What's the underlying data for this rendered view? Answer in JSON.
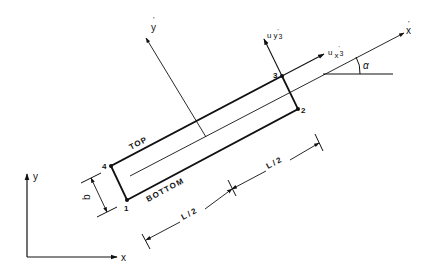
{
  "diagram": {
    "global_axes": {
      "x_label": "x",
      "y_label": "y"
    },
    "local_axes": {
      "x_label": "x",
      "x_prime": "'",
      "y_label": "y",
      "y_prime": "'"
    },
    "angle_label": "α",
    "nodes": [
      {
        "id": "1",
        "label": "1"
      },
      {
        "id": "2",
        "label": "2"
      },
      {
        "id": "3",
        "label": "3"
      },
      {
        "id": "4",
        "label": "4"
      }
    ],
    "displacements": {
      "u_x3": {
        "u": "u",
        "sub": "x",
        "prime": "'",
        "index": "3"
      },
      "u_y3": {
        "u": "u",
        "sub": "y",
        "prime": "'",
        "index": "3"
      }
    },
    "edge_labels": {
      "top": "TOP",
      "bottom": "BOTTOM"
    },
    "dimensions": {
      "height": "b",
      "half_length_1": "L / 2",
      "half_length_2": "L / 2"
    },
    "colors": {
      "line": "#111111",
      "background": "#ffffff"
    }
  }
}
